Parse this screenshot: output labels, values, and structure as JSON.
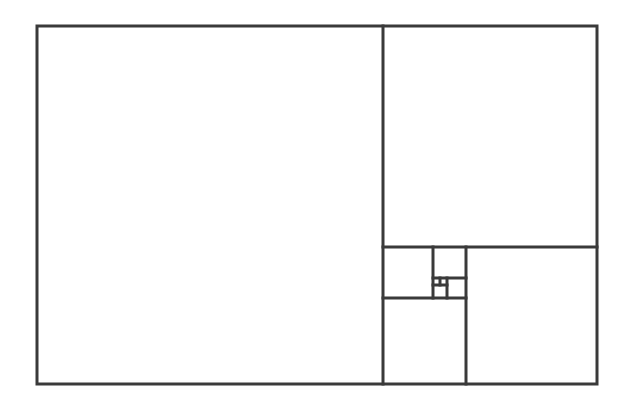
{
  "diagram": {
    "type": "golden-rectangle-subdivision",
    "stroke_color": "#3a3a3a",
    "background": "#ffffff",
    "stroke_width": 3,
    "outer_rect": {
      "x": 37,
      "y": 26,
      "w": 560,
      "h": 358
    },
    "lines": [
      {
        "id": "v-main",
        "x1": 383,
        "y1": 26,
        "x2": 383,
        "y2": 384
      },
      {
        "id": "h-1",
        "x1": 383,
        "y1": 247,
        "x2": 597,
        "y2": 247
      },
      {
        "id": "v-2",
        "x1": 466,
        "y1": 247,
        "x2": 466,
        "y2": 384
      },
      {
        "id": "h-3",
        "x1": 383,
        "y1": 298,
        "x2": 466,
        "y2": 298
      },
      {
        "id": "v-4",
        "x1": 433,
        "y1": 247,
        "x2": 433,
        "y2": 298
      },
      {
        "id": "h-5",
        "x1": 433,
        "y1": 278,
        "x2": 466,
        "y2": 278
      },
      {
        "id": "v-6",
        "x1": 447,
        "y1": 278,
        "x2": 447,
        "y2": 298
      },
      {
        "id": "h-7",
        "x1": 433,
        "y1": 285,
        "x2": 447,
        "y2": 285
      },
      {
        "id": "v-8",
        "x1": 440,
        "y1": 278,
        "x2": 440,
        "y2": 285
      }
    ]
  }
}
